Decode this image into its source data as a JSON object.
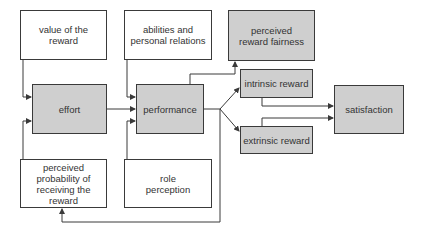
{
  "diagram": {
    "type": "flowchart",
    "colors": {
      "shaded_box": "#cfcfcf",
      "plain_box": "#ffffff",
      "line": "#3a3a3a"
    },
    "nodes": {
      "value_of_reward": "value of the reward",
      "abilities": "abilities and personal relations",
      "perceived_fairness": "perceived reward fairness",
      "effort": "effort",
      "performance": "performance",
      "intrinsic": "intrinsic reward",
      "extrinsic": "extrinsic reward",
      "satisfaction": "satisfaction",
      "perceived_probability": "perceived probability of receiving the reward",
      "role_perception": "role perception"
    },
    "edges": [
      [
        "value of the reward",
        "effort"
      ],
      [
        "perceived probability of receiving the reward",
        "effort"
      ],
      [
        "effort",
        "performance"
      ],
      [
        "abilities and personal relations",
        "performance"
      ],
      [
        "role perception",
        "performance"
      ],
      [
        "performance",
        "perceived reward fairness"
      ],
      [
        "performance",
        "intrinsic reward"
      ],
      [
        "performance",
        "extrinsic reward"
      ],
      [
        "performance",
        "perceived probability of receiving the reward"
      ],
      [
        "intrinsic reward",
        "satisfaction"
      ],
      [
        "extrinsic reward",
        "satisfaction"
      ]
    ]
  }
}
